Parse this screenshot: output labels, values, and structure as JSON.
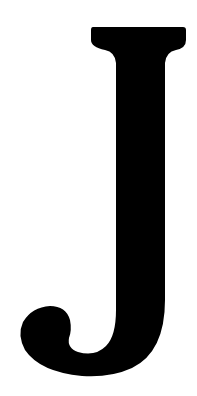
{
  "image": {
    "letter": "J",
    "background_color": "#ffffff",
    "glyph_color": "#000000"
  }
}
